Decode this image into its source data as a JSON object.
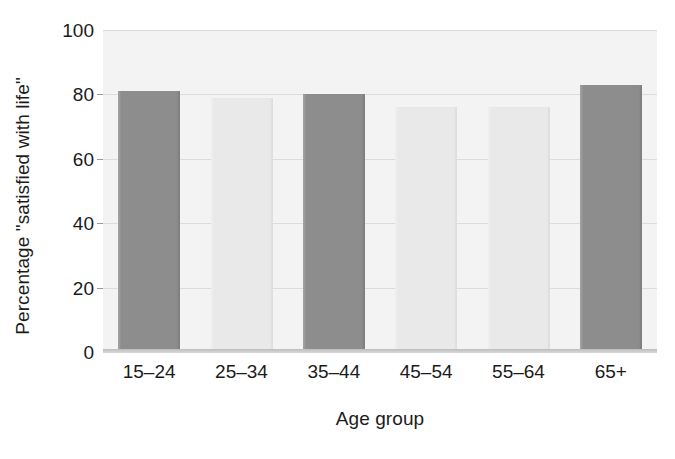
{
  "chart_data": {
    "type": "bar",
    "title": "",
    "subtitle": "",
    "xlabel": "Age group",
    "ylabel": "Percentage \"satisfied with life\"",
    "categories": [
      "15–24",
      "25–34",
      "35–44",
      "45–54",
      "55–64",
      "65+"
    ],
    "values": [
      81,
      79,
      80,
      76,
      76,
      83
    ],
    "series": [
      {
        "name": "Percentage \"satisfied with life\"",
        "values": [
          81,
          79,
          80,
          76,
          76,
          83
        ]
      }
    ],
    "ylim": [
      0,
      100
    ],
    "yticks": [
      0,
      20,
      40,
      60,
      80,
      100
    ],
    "ytick_labels": [
      "0",
      "20",
      "40",
      "60",
      "80",
      "100"
    ],
    "grid": true,
    "grid_axis": "y",
    "legend": false,
    "legend_position": "none",
    "bar_shades": [
      "dark",
      "light",
      "dark",
      "light",
      "light",
      "dark"
    ],
    "annotations": [],
    "colors": {
      "bar_dark": "#8d8d8d",
      "bar_light": "#e9e9e9",
      "plot_background": "#f3f3f3",
      "gridline": "#dcdcdc",
      "axis": "#bdbdbd",
      "text": "#1b1b1b",
      "figure_background": "#ffffff"
    }
  }
}
